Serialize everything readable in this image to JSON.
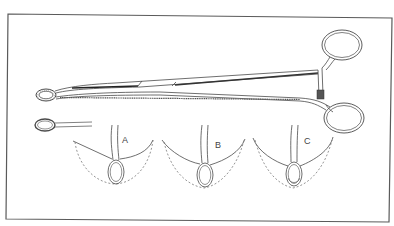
{
  "figure": {
    "engraving_text": "",
    "views": [
      {
        "id": "A",
        "label": "A"
      },
      {
        "id": "B",
        "label": "B"
      },
      {
        "id": "C",
        "label": "C"
      }
    ],
    "colors": {
      "background": "#ffffff",
      "frame": "#5a5a5a",
      "line": "#4a4a4a",
      "dash": "#7a7a7a",
      "hatch": "#3a3a3a"
    }
  }
}
